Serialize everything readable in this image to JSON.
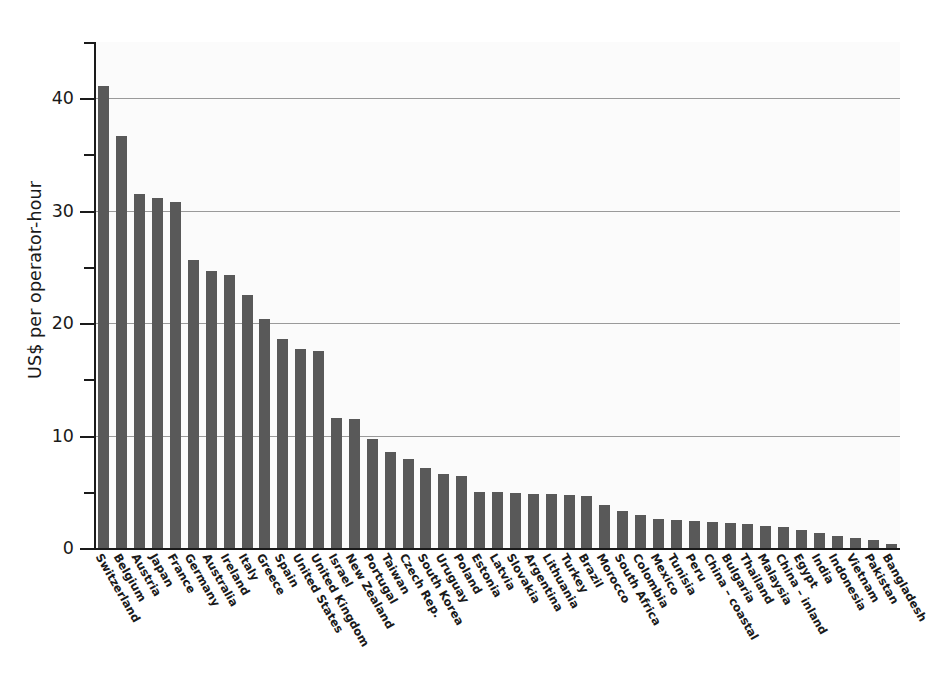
{
  "chart_data": {
    "type": "bar",
    "title": "",
    "subtitle": "",
    "xlabel": "",
    "ylabel": "US$ per operator-hour",
    "ylim": [
      0,
      45
    ],
    "ytick_labels": [
      "0",
      "10",
      "20",
      "30",
      "40"
    ],
    "ytick_values": [
      0,
      10,
      20,
      30,
      40
    ],
    "yminor_values": [
      5,
      15,
      25,
      35,
      45
    ],
    "grid": "horizontal-major",
    "legend": "none",
    "bar_color": "#595959",
    "plot_background": "#fbfbfb",
    "axis_color": "#1a1a1a",
    "gridline_color": "#9a9a9a",
    "categories": [
      "Switzerland",
      "Belgium",
      "Austria",
      "Japan",
      "France",
      "Germany",
      "Australia",
      "Ireland",
      "Italy",
      "Greece",
      "Spain",
      "United States",
      "United Kingdom",
      "Israel",
      "New Zealand",
      "Portugal",
      "Taiwan",
      "Czech Rep.",
      "South Korea",
      "Uruguay",
      "Poland",
      "Estonia",
      "Latvia",
      "Slovakia",
      "Argentina",
      "Lithuania",
      "Turkey",
      "Brazil",
      "Morocco",
      "South Africa",
      "Colombia",
      "Mexico",
      "Tunisia",
      "Peru",
      "China – coastal",
      "Bulgaria",
      "Thailand",
      "Malaysia",
      "China – inland",
      "Egypt",
      "India",
      "Indonesia",
      "Vietnam",
      "Pakistan",
      "Bangladesh"
    ],
    "values": [
      41.1,
      36.6,
      31.5,
      31.1,
      30.8,
      25.6,
      24.6,
      24.3,
      22.5,
      20.4,
      18.6,
      17.7,
      17.5,
      11.6,
      11.5,
      9.7,
      8.5,
      7.9,
      7.1,
      6.6,
      6.4,
      5.0,
      5.0,
      4.9,
      4.8,
      4.8,
      4.7,
      4.6,
      3.8,
      3.3,
      2.9,
      2.6,
      2.5,
      2.4,
      2.3,
      2.2,
      2.1,
      2.0,
      1.9,
      1.6,
      1.3,
      1.1,
      0.9,
      0.7,
      0.4
    ]
  }
}
